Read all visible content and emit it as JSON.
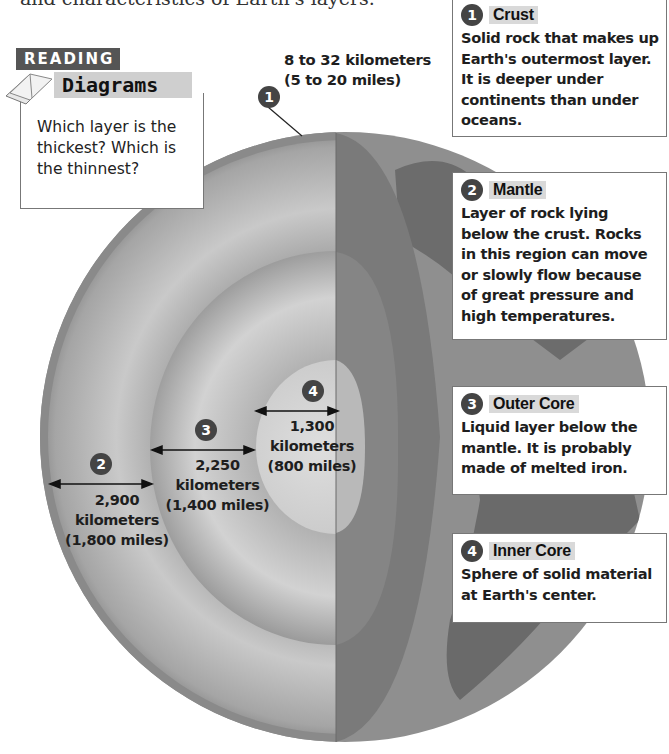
{
  "intro_text": "and characteristics of Earth's layers.",
  "reading_diagrams": {
    "badge": "READING",
    "title": "Diagrams",
    "question": "Which layer is the thickest? Which is the thinnest?",
    "icon": "open-book-icon"
  },
  "crust_measure": {
    "number": "1",
    "km": "8 to 32 kilometers",
    "miles": "(5 to 20 miles)"
  },
  "measures": [
    {
      "number": "2",
      "value": "2,900",
      "unit": "kilometers",
      "miles": "(1,800 miles)"
    },
    {
      "number": "3",
      "value": "2,250",
      "unit": "kilometers",
      "miles": "(1,400 miles)"
    },
    {
      "number": "4",
      "value": "1,300",
      "unit": "kilometers",
      "miles": "(800 miles)"
    }
  ],
  "callouts": [
    {
      "number": "1",
      "title": "Crust",
      "body": "Solid rock that makes up Earth's outermost layer. It is deeper under continents than under oceans."
    },
    {
      "number": "2",
      "title": "Mantle",
      "body": "Layer of rock lying below the crust. Rocks in this region can move or slowly flow because of great pressure and high temperatures."
    },
    {
      "number": "3",
      "title": "Outer Core",
      "body": "Liquid layer below the mantle. It is probably made of melted iron."
    },
    {
      "number": "4",
      "title": "Inner Core",
      "body": "Sphere of solid material at Earth's center."
    }
  ],
  "colors": {
    "badge_bg": "#555555",
    "title_bg": "#cfcfcf",
    "number_circle": "#444444",
    "callout_border": "#777777"
  }
}
